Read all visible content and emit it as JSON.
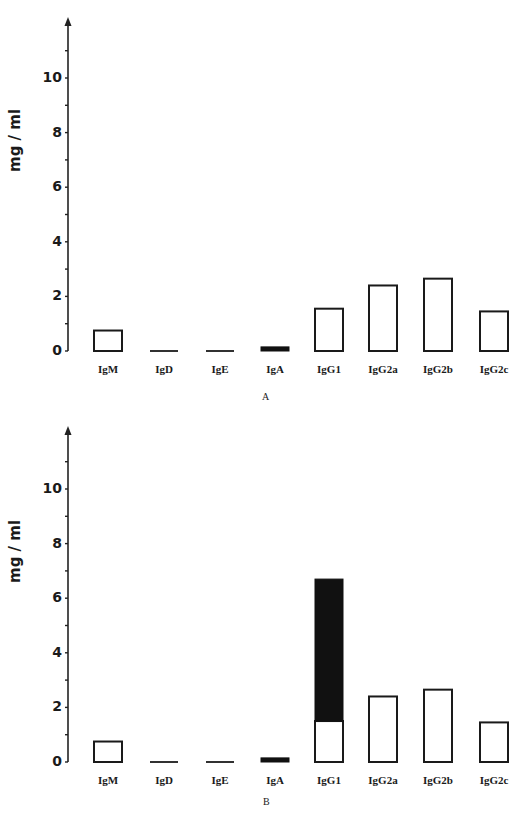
{
  "chart_data": [
    {
      "type": "bar",
      "panel": "A",
      "title": "",
      "caption": "A",
      "xlabel": "",
      "ylabel": "mg / ml",
      "ylim": [
        0,
        12
      ],
      "yticks": [
        0,
        2,
        4,
        6,
        8,
        10
      ],
      "categories": [
        "IgM",
        "IgD",
        "IgE",
        "IgA",
        "IgG1",
        "IgG2a",
        "IgG2b",
        "IgG2c"
      ],
      "series": [
        {
          "name": "open",
          "values": [
            0.75,
            0.03,
            0.03,
            0.0,
            1.55,
            2.4,
            2.65,
            1.45
          ]
        },
        {
          "name": "filled",
          "values": [
            0,
            0,
            0,
            0.15,
            0,
            0,
            0,
            0
          ]
        }
      ],
      "grid": false
    },
    {
      "type": "bar",
      "panel": "B",
      "title": "",
      "caption": "B",
      "xlabel": "",
      "ylabel": "mg / ml",
      "ylim": [
        0,
        12
      ],
      "yticks": [
        0,
        2,
        4,
        6,
        8,
        10
      ],
      "categories": [
        "IgM",
        "IgD",
        "IgE",
        "IgA",
        "IgG1",
        "IgG2a",
        "IgG2b",
        "IgG2c"
      ],
      "series": [
        {
          "name": "open",
          "values": [
            0.75,
            0.03,
            0.03,
            0.0,
            1.5,
            2.4,
            2.65,
            1.45
          ]
        },
        {
          "name": "filled",
          "values": [
            0,
            0,
            0,
            0.15,
            5.2,
            0,
            0,
            0
          ]
        }
      ],
      "grid": false
    }
  ],
  "panels": {
    "A": {
      "ylabel": "mg / ml",
      "caption": "A"
    },
    "B": {
      "ylabel": "mg / ml",
      "caption": "B"
    }
  }
}
